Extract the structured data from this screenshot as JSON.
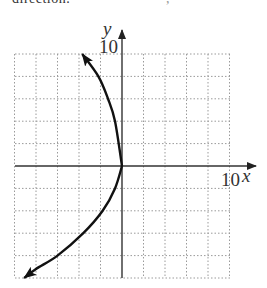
{
  "header": {
    "clipped_text": "direction.",
    "clipped_text_right": ","
  },
  "chart_data": {
    "type": "line",
    "title": "",
    "xlabel": "x",
    "ylabel": "y",
    "xlim": [
      -10,
      10
    ],
    "ylim": [
      -10,
      10
    ],
    "grid": true,
    "grid_step": 2,
    "tick_labels": {
      "x": "10",
      "y": "10"
    },
    "series": [
      {
        "name": "curve",
        "arrows_at_ends": true,
        "x": [
          -9.1,
          -8.0,
          -6.0,
          -3.6,
          -1.8,
          -0.65,
          0.0,
          -0.65,
          -1.3,
          -2.2,
          -3.7
        ],
        "y": [
          -10.0,
          -9.2,
          -8.0,
          -6.0,
          -4.0,
          -2.0,
          0.0,
          4.0,
          6.0,
          8.0,
          10.0
        ]
      }
    ]
  }
}
